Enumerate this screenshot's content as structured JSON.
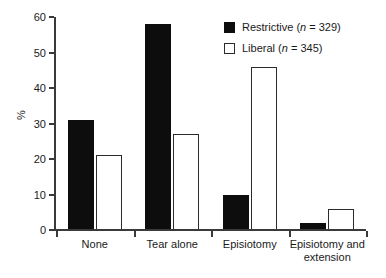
{
  "chart_data": {
    "type": "bar",
    "title": "",
    "xlabel": "",
    "ylabel": "%",
    "ylim": [
      0,
      60
    ],
    "yticks": [
      0,
      10,
      20,
      30,
      40,
      50,
      60
    ],
    "grid": false,
    "legend_position": "top-right",
    "categories": [
      "None",
      "Tear alone",
      "Episiotomy",
      "Episiotomy and extension"
    ],
    "category_lines": [
      [
        "None"
      ],
      [
        "Tear alone"
      ],
      [
        "Episiotomy"
      ],
      [
        "Episiotomy and",
        "extension"
      ]
    ],
    "series": [
      {
        "name": "Restrictive",
        "legend_label": "Restrictive (n = 329)",
        "n": 329,
        "color": "#0d0d0d",
        "style": "filled",
        "values": [
          31,
          58,
          10,
          2
        ]
      },
      {
        "name": "Liberal",
        "legend_label": "Liberal (n = 345)",
        "n": 345,
        "color": "#ffffff",
        "edge_color": "#2b2b2b",
        "style": "outlined",
        "values": [
          21,
          27,
          46,
          6
        ]
      }
    ]
  },
  "legend": {
    "items": [
      {
        "label_name": "Restrictive",
        "n_prefix": " (",
        "n_symbol": "n",
        "n_value": " = 329)",
        "swatch": "filled-square-icon"
      },
      {
        "label_name": "Liberal",
        "n_prefix": " (",
        "n_symbol": "n",
        "n_value": " = 345)",
        "swatch": "outlined-square-icon"
      }
    ]
  },
  "axes": {
    "y_title": "%",
    "y_tick_labels": [
      "60",
      "50",
      "40",
      "30",
      "20",
      "10",
      "0"
    ],
    "x_tick_labels": [
      "None",
      "Tear alone",
      "Episiotomy",
      "Episiotomy and extension"
    ]
  },
  "caption": {
    "remnant": ""
  }
}
